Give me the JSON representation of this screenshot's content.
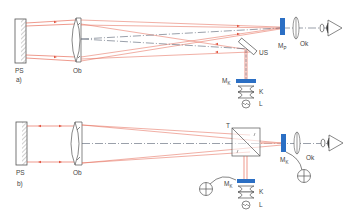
{
  "colors": {
    "ray": "#e2553f",
    "ray_light": "#f0a79a",
    "axis": "#556070",
    "outline": "#555555",
    "marker": "#2b6fc4",
    "hatch": "#777777"
  },
  "panels": [
    {
      "id": "a",
      "label": "a)",
      "components": {
        "plane_mirror": "PS",
        "objective": "Ob",
        "reticle_eyepiece_focal": "M",
        "reticle_eyepiece_sub": "P",
        "eyepiece": "Ok",
        "beam_splitter": "US",
        "reticle_collimator": "M",
        "reticle_collimator_sub": "K",
        "condenser": "K",
        "lamp": "L"
      },
      "icons": [
        "eye-icon",
        "lamp-icon",
        "condenser-icon"
      ]
    },
    {
      "id": "b",
      "label": "b)",
      "components": {
        "plane_mirror": "PS",
        "objective": "Ob",
        "splitter_cube": "T",
        "reticle_eyepiece": "M",
        "reticle_eyepiece_sub": "K",
        "eyepiece": "Ok",
        "reticle_collimator": "M",
        "reticle_collimator_sub": "K",
        "condenser": "K",
        "lamp": "L"
      },
      "icons": [
        "eye-icon",
        "lamp-icon",
        "condenser-icon",
        "crosshair-reticle-icon"
      ]
    }
  ]
}
